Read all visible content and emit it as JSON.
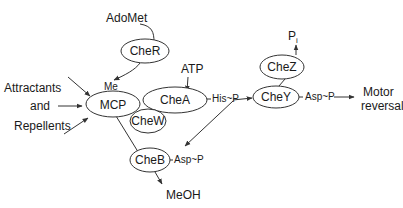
{
  "diagram": {
    "nodes": {
      "mcp": "MCP",
      "cher": "CheR",
      "chea": "CheA",
      "chew": "CheW",
      "cheb": "CheB",
      "chey": "CheY",
      "chez": "CheZ"
    },
    "labels": {
      "adomet": "AdoMet",
      "atp": "ATP",
      "me": "Me",
      "attractants": "Attractants",
      "and": "and",
      "repellents": "Repellents",
      "his_p": "His~P",
      "asp_p_chey": "Asp~P",
      "asp_p_cheb": "Asp~P",
      "meoh": "MeOH",
      "pi": "P",
      "pi_sub": "i",
      "motor": "Motor",
      "reversal": "reversal"
    },
    "colors": {
      "stroke": "#333333",
      "text": "#1a1a1a",
      "background": "#ffffff"
    }
  }
}
